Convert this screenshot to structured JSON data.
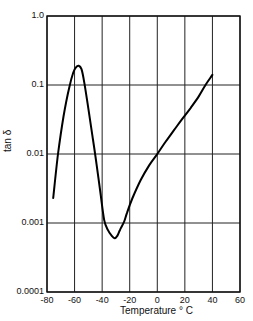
{
  "chart_data": {
    "type": "line",
    "title": "",
    "xlabel": "Temperature ° C",
    "ylabel": "tan δ",
    "xlim": [
      -80,
      60
    ],
    "ylim": [
      0.0001,
      1.0
    ],
    "yscale": "log",
    "grid": true,
    "legend": null,
    "x_ticks": [
      "-80",
      "-60",
      "-40",
      "-20",
      "0",
      "20",
      "40",
      "60"
    ],
    "y_ticks": [
      "1.0",
      "0.1",
      "0.01",
      "0.001",
      "0.0001"
    ],
    "series": [
      {
        "name": "tan δ",
        "x": [
          -75.5,
          -72,
          -68,
          -64,
          -61,
          -59,
          -57,
          -55,
          -53,
          -50,
          -47,
          -44,
          -41,
          -38.5,
          -36,
          -33,
          -31,
          -29,
          -27,
          -24,
          -22,
          -18,
          -12,
          -6,
          0,
          6,
          12,
          18,
          24,
          30,
          35,
          40
        ],
        "values": [
          0.0023,
          0.01,
          0.035,
          0.09,
          0.15,
          0.18,
          0.19,
          0.17,
          0.11,
          0.045,
          0.018,
          0.007,
          0.0025,
          0.0011,
          0.0008,
          0.00065,
          0.0006,
          0.00065,
          0.0008,
          0.00105,
          0.0014,
          0.0023,
          0.0042,
          0.0068,
          0.01,
          0.015,
          0.022,
          0.032,
          0.046,
          0.068,
          0.1,
          0.14
        ]
      }
    ]
  },
  "axes": {
    "x_label": "Temperature ° C",
    "y_label": "tan δ"
  }
}
